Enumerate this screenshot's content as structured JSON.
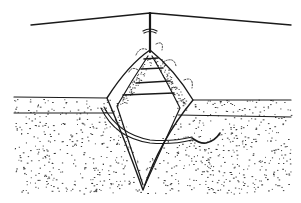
{
  "figure": {
    "type": "line-art illustration",
    "colors": {
      "ink": "#1a1a1a",
      "background": "#ffffff",
      "stipple": "#2a2a2a"
    },
    "wire": {
      "left": [
        31,
        25
      ],
      "peak": [
        150,
        13
      ],
      "right": [
        291,
        25
      ]
    },
    "pole": {
      "x": 150,
      "top": 13,
      "bottom": 50
    },
    "diamond_outer": {
      "top": [
        150,
        50
      ],
      "left": [
        107,
        98
      ],
      "right": [
        193,
        100
      ],
      "bottom": [
        143,
        190
      ]
    },
    "ground": {
      "surface_left_y": 97,
      "surface_right_y": 100,
      "layer_left_y": 113,
      "layer_right_y": 117
    },
    "rungs_y": [
      58,
      68,
      82,
      94
    ],
    "tube": {
      "start": [
        102,
        108
      ],
      "end": [
        190,
        142
      ],
      "hook_end": [
        220,
        133
      ]
    }
  }
}
